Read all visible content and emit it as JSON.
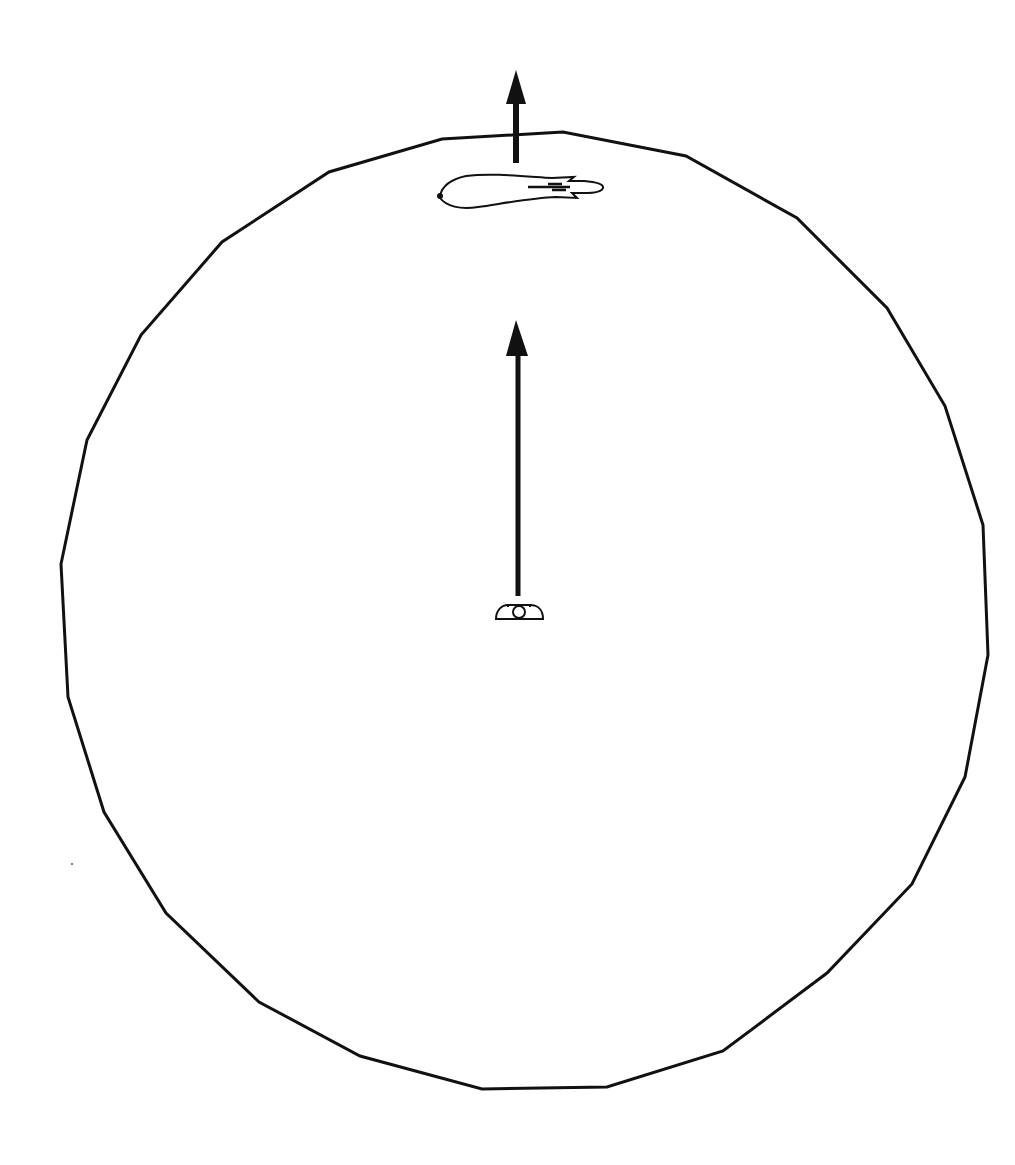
{
  "diagram": {
    "title": "",
    "background": "#ffffff",
    "stroke_color": "#111111",
    "boundary": {
      "shape": "polygon",
      "description": "Large near-circular polygon boundary (arena / dish outline)",
      "points": [
        [
          442,
          139
        ],
        [
          563,
          132
        ],
        [
          686,
          156
        ],
        [
          797,
          218
        ],
        [
          887,
          308
        ],
        [
          945,
          406
        ],
        [
          983,
          525
        ],
        [
          988,
          655
        ],
        [
          965,
          777
        ],
        [
          912,
          884
        ],
        [
          827,
          973
        ],
        [
          723,
          1051
        ],
        [
          607,
          1087
        ],
        [
          482,
          1089
        ],
        [
          360,
          1056
        ],
        [
          259,
          1002
        ],
        [
          166,
          913
        ],
        [
          104,
          812
        ],
        [
          68,
          697
        ],
        [
          61,
          564
        ],
        [
          87,
          440
        ],
        [
          141,
          335
        ],
        [
          222,
          242
        ],
        [
          329,
          172
        ]
      ]
    },
    "start_marker": {
      "icon": "start-device-icon",
      "description": "Small rounded device / start-point glyph at arena center",
      "x": 519,
      "y": 613
    },
    "center_arrow": {
      "description": "Long vertical arrow pointing up from start point",
      "x": 518,
      "y_start": 596,
      "y_end": 320
    },
    "top_arrow": {
      "description": "Short vertical arrow above target at the boundary, pointing up",
      "x": 516,
      "y_start": 163,
      "y_end": 70
    },
    "target": {
      "icon": "elongated-organism-icon",
      "description": "Elongated outlined organism shape near top boundary with arrow marks inside",
      "x": 520,
      "y": 192
    }
  }
}
